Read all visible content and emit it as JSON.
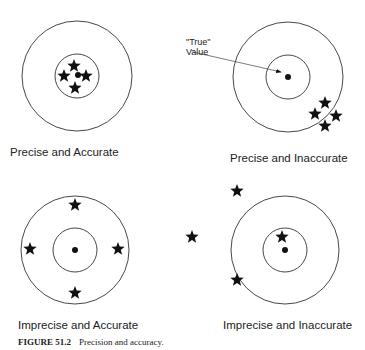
{
  "panels": [
    {
      "id": "precise-accurate",
      "label": "Precise and Accurate",
      "center": [
        77,
        76
      ],
      "outer_r": 55,
      "inner_r": 22,
      "dot": [
        78,
        75
      ],
      "stars": [
        [
          74,
          66
        ],
        [
          64,
          76
        ],
        [
          86,
          76
        ],
        [
          75,
          88
        ]
      ],
      "label_pos": [
        10,
        146
      ]
    },
    {
      "id": "precise-inaccurate",
      "label": "Precise and Inaccurate",
      "center": [
        288,
        77
      ],
      "outer_r": 55,
      "inner_r": 22,
      "dot": [
        288,
        77
      ],
      "stars": [
        [
          325,
          103
        ],
        [
          315,
          114
        ],
        [
          336,
          116
        ],
        [
          325,
          126
        ]
      ],
      "label_pos": [
        230,
        152
      ]
    },
    {
      "id": "imprecise-accurate",
      "label": "Imprecise and Accurate",
      "center": [
        75,
        250
      ],
      "outer_r": 54,
      "inner_r": 22,
      "dot": [
        75,
        250
      ],
      "stars": [
        [
          75,
          205
        ],
        [
          30,
          249
        ],
        [
          118,
          249
        ],
        [
          75,
          293
        ]
      ],
      "label_pos": [
        18,
        319
      ]
    },
    {
      "id": "imprecise-inaccurate",
      "label": "Imprecise and Inaccurate",
      "center": [
        285,
        250
      ],
      "outer_r": 54,
      "inner_r": 22,
      "dot": [
        285,
        250
      ],
      "stars": [
        [
          237,
          191
        ],
        [
          192,
          237
        ],
        [
          282,
          237
        ],
        [
          237,
          280
        ]
      ],
      "label_pos": [
        223,
        319
      ]
    }
  ],
  "annotation": {
    "line1": "\"True\"",
    "line2": "Value",
    "arrow_from": [
      193,
      52
    ],
    "arrow_to": [
      281,
      72
    ]
  },
  "caption": {
    "number": "FIGURE 51.2",
    "text": "Precision and accuracy."
  }
}
